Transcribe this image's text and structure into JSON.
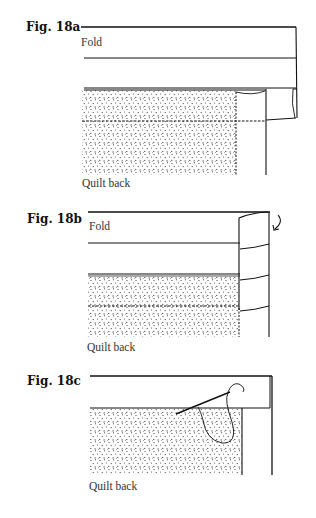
{
  "figures": [
    {
      "id": "18a",
      "title": "Fig. 18a",
      "fold_label": "Fold",
      "caption": "Quilt back"
    },
    {
      "id": "18b",
      "title": "Fig. 18b",
      "fold_label": "Fold",
      "caption": "Quilt back"
    },
    {
      "id": "18c",
      "title": "Fig. 18c",
      "caption": "Quilt back"
    }
  ],
  "colors": {
    "line": "#111111",
    "dots": "#333333",
    "background": "#ffffff"
  }
}
